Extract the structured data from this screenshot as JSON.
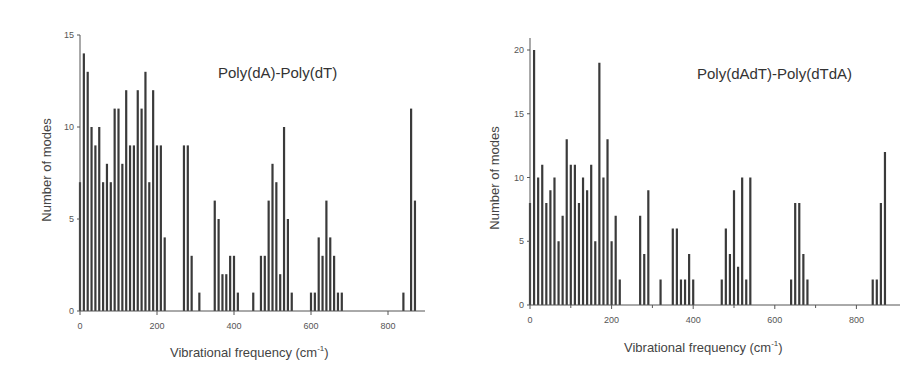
{
  "chart_data": [
    {
      "type": "bar",
      "title": "Poly(dA)-Poly(dT)",
      "xlabel": "Vibrational frequency (cm⁻¹)",
      "ylabel": "Number of modes",
      "xlim": [
        0,
        900
      ],
      "ylim": [
        0,
        15
      ],
      "xticks": [
        0,
        200,
        400,
        600,
        800
      ],
      "yticks": [
        0,
        5,
        10,
        15
      ],
      "grid": false,
      "legend": null,
      "x": [
        0,
        10,
        20,
        30,
        40,
        50,
        60,
        70,
        80,
        90,
        100,
        110,
        120,
        130,
        140,
        150,
        160,
        170,
        180,
        190,
        200,
        210,
        220,
        270,
        280,
        290,
        310,
        350,
        360,
        370,
        380,
        390,
        400,
        410,
        450,
        470,
        480,
        490,
        500,
        510,
        520,
        530,
        540,
        550,
        600,
        610,
        620,
        630,
        640,
        650,
        660,
        670,
        680,
        840,
        860,
        870
      ],
      "values": [
        7,
        14,
        13,
        10,
        9,
        10,
        7,
        8,
        7,
        11,
        11,
        8,
        12,
        9,
        9,
        12,
        11,
        13,
        7,
        12,
        9,
        9,
        4,
        9,
        9,
        3,
        1,
        6,
        5,
        2,
        2,
        3,
        3,
        1,
        1,
        3,
        3,
        6,
        8,
        7,
        2,
        10,
        5,
        1,
        1,
        1,
        4,
        3,
        6,
        4,
        3,
        1,
        1,
        1,
        11,
        6
      ]
    },
    {
      "type": "bar",
      "title": "Poly(dAdT)-Poly(dTdA)",
      "xlabel": "Vibrational frequency  (cm⁻¹)",
      "ylabel": "Number of modes",
      "xlim": [
        0,
        900
      ],
      "ylim": [
        0,
        21
      ],
      "xticks": [
        0,
        200,
        400,
        600,
        800
      ],
      "yticks": [
        0,
        5,
        10,
        15,
        20
      ],
      "grid": false,
      "legend": null,
      "x": [
        0,
        10,
        20,
        30,
        40,
        50,
        60,
        70,
        80,
        90,
        100,
        110,
        120,
        130,
        140,
        150,
        160,
        170,
        180,
        190,
        200,
        210,
        220,
        270,
        280,
        290,
        320,
        350,
        360,
        370,
        380,
        390,
        400,
        470,
        480,
        490,
        500,
        510,
        520,
        530,
        540,
        640,
        650,
        660,
        670,
        680,
        840,
        850,
        860,
        870
      ],
      "values": [
        8,
        20,
        10,
        11,
        8,
        9,
        10,
        5,
        7,
        13,
        11,
        11,
        8,
        10,
        9,
        11,
        5,
        19,
        10,
        13,
        5,
        7,
        2,
        7,
        4,
        9,
        2,
        6,
        6,
        2,
        2,
        4,
        2,
        2,
        6,
        4,
        9,
        3,
        10,
        2,
        10,
        2,
        8,
        8,
        4,
        2,
        2,
        2,
        8,
        12
      ]
    }
  ],
  "charts": {
    "left": {
      "title": "Poly(dA)-Poly(dT)",
      "ylabel": "Number of modes",
      "xlabel_main": "Vibrational frequency (cm",
      "xlabel_sup": "-1",
      "xlabel_end": ")"
    },
    "right": {
      "title": "Poly(dAdT)-Poly(dTdA)",
      "ylabel": "Number of modes",
      "xlabel_main": "Vibrational frequency  (cm",
      "xlabel_sup": "-1",
      "xlabel_end": ")"
    }
  },
  "colors": {
    "bar": "#3a3a3a",
    "axis": "#555555",
    "text": "#444444"
  }
}
